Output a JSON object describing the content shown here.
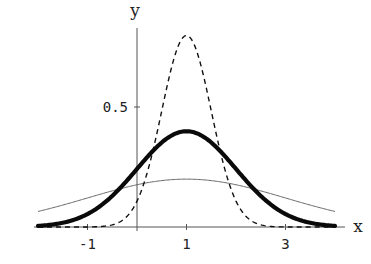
{
  "chart_data": {
    "type": "line",
    "title": "",
    "xlabel": "x",
    "ylabel": "y",
    "xlim": [
      -2,
      4
    ],
    "ylim": [
      0,
      0.8
    ],
    "grid": false,
    "legend": null,
    "x_ticks": [
      {
        "value": -1,
        "label": "-1"
      },
      {
        "value": 1,
        "label": "1"
      },
      {
        "value": 3,
        "label": "3"
      }
    ],
    "y_ticks": [
      {
        "value": 0.5,
        "label": "0.5"
      }
    ],
    "series": [
      {
        "name": "Normal(mu=1, sigma=0.5)",
        "style": "dashed",
        "mean": 1,
        "sd": 0.5,
        "peak": 0.798,
        "x": [
          -2,
          -1,
          0,
          0.5,
          1,
          1.5,
          2,
          3,
          4
        ],
        "values": [
          0.0,
          0.0,
          0.108,
          0.484,
          0.798,
          0.484,
          0.108,
          0.0,
          0.0
        ]
      },
      {
        "name": "Normal(mu=1, sigma=1)",
        "style": "thick",
        "mean": 1,
        "sd": 1,
        "peak": 0.399,
        "x": [
          -2,
          -1,
          0,
          0.5,
          1,
          1.5,
          2,
          3,
          4
        ],
        "values": [
          0.004,
          0.054,
          0.242,
          0.352,
          0.399,
          0.352,
          0.242,
          0.054,
          0.004
        ]
      },
      {
        "name": "Normal(mu=1, sigma=2)",
        "style": "thin",
        "mean": 1,
        "sd": 2,
        "peak": 0.199,
        "x": [
          -2,
          -1,
          0,
          0.5,
          1,
          1.5,
          2,
          3,
          4
        ],
        "values": [
          0.065,
          0.121,
          0.176,
          0.193,
          0.199,
          0.193,
          0.176,
          0.121,
          0.065
        ]
      }
    ]
  },
  "layout": {
    "origin_px": [
      137,
      227
    ],
    "px_per_x": 49.5,
    "px_per_y": 240,
    "colors": {
      "axis": "#555555",
      "dashed": "#111111",
      "thick": "#0a0a0a",
      "thin": "#666666"
    }
  }
}
